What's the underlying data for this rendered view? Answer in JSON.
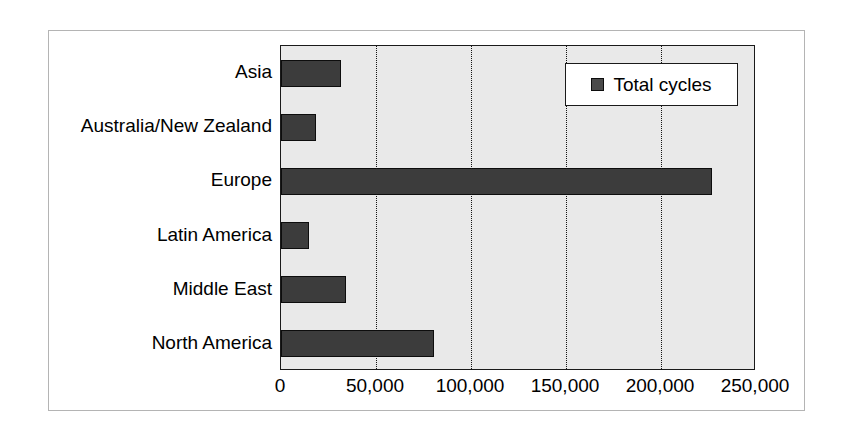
{
  "chart_data": {
    "type": "bar",
    "orientation": "horizontal",
    "title": "",
    "xlabel": "",
    "ylabel": "",
    "categories": [
      "Asia",
      "Australia/New Zealand",
      "Europe",
      "Latin America",
      "Middle East",
      "North America"
    ],
    "series": [
      {
        "name": "Total cycles",
        "values": [
          31500,
          18500,
          227000,
          14500,
          34000,
          80500
        ]
      }
    ],
    "xlim": [
      0,
      250000
    ],
    "xticks": [
      0,
      50000,
      100000,
      150000,
      200000,
      250000
    ],
    "xticklabels": [
      "0",
      "50,000",
      "100,000",
      "150,000",
      "200,000",
      "250,000"
    ],
    "grid": {
      "vertical": true,
      "horizontal": false,
      "style": "dotted",
      "color": "#141414"
    },
    "legend": {
      "position": "top-right",
      "entries": [
        {
          "label": "Total cycles",
          "color": "#4a4a4a"
        }
      ]
    },
    "colors": {
      "bar_fill": "#3c3c3c",
      "bar_edge": "#0d0d0d",
      "plot_background": "#e9e9e9",
      "figure_background": "#ffffff",
      "frame_border": "#b4b4b4",
      "axis_line": "#1a1a1a",
      "text": "#000000"
    }
  }
}
